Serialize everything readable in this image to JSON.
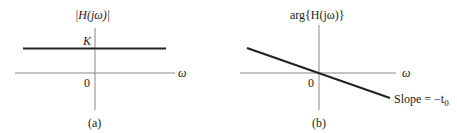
{
  "panel_a": {
    "ylabel": "|H(jω)|",
    "level_label": "K",
    "origin_label": "0",
    "xlabel": "ω",
    "caption": "(a)"
  },
  "panel_b": {
    "ylabel": "arg{H(jω)}",
    "origin_label": "0",
    "xlabel": "ω",
    "slope_label": "Slope = −t",
    "slope_sub": "0",
    "caption": "(b)"
  },
  "colors": {
    "axis": "#777777",
    "curve": "#222222"
  }
}
